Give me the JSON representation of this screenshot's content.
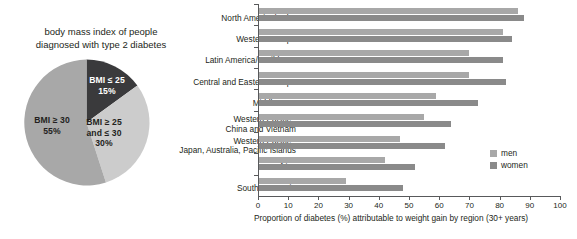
{
  "pie": {
    "title": "body mass index of people diagnosed with type 2 diabetes",
    "title_line1": "body mass index of people",
    "title_line2": "diagnosed with type 2 diabetes",
    "slices": [
      {
        "label_line1": "BMI ≤ 25",
        "label_line2": "15%",
        "value": 15,
        "color": "#3a3a3c"
      },
      {
        "label_line1": "BMI ≥ 25",
        "label_line2": "and ≤ 30",
        "label_line3": "30%",
        "value": 30,
        "color": "#cccccc"
      },
      {
        "label_line1": "BMI ≥ 30",
        "label_line2": "55%",
        "value": 55,
        "color": "#a8a8a8"
      }
    ]
  },
  "legend": {
    "items": [
      {
        "label": "men",
        "color": "#a8a8a8"
      },
      {
        "label": "women",
        "color": "#8a8a8a"
      }
    ]
  },
  "chart_data": {
    "type": "bar",
    "title": "",
    "xlabel": "Proportion of diabetes (%) attributable to weight gain by region (30+ years)",
    "ylabel": "",
    "xlim": [
      0,
      100
    ],
    "xticks": [
      0,
      10,
      20,
      30,
      40,
      50,
      60,
      70,
      80,
      90,
      100
    ],
    "grid": false,
    "legend_position": "right-inside",
    "orientation": "horizontal",
    "categories": [
      "North America/Cuba",
      "Western Europe",
      "Latin America/Caribbean",
      "Central and Eastern Europe",
      "Middle East",
      "Western Pacific - China and Vietnam",
      "Western Pacific - Japan, Australia, Pacific Islands",
      "Africa",
      "South-East Asia"
    ],
    "category_lines": [
      [
        "North America/Cuba"
      ],
      [
        "Western Europe"
      ],
      [
        "Latin America/Caribbean"
      ],
      [
        "Central and Eastern Europe"
      ],
      [
        "Middle East"
      ],
      [
        "Western Pacific -",
        "China and Vietnam"
      ],
      [
        "Western Pacific -",
        "Japan, Australia, Pacific Islands"
      ],
      [
        "Africa"
      ],
      [
        "South-East Asia"
      ]
    ],
    "series": [
      {
        "name": "men",
        "color": "#a8a8a8",
        "values": [
          86,
          81,
          70,
          70,
          59,
          55,
          47,
          42,
          29
        ]
      },
      {
        "name": "women",
        "color": "#8a8a8a",
        "values": [
          88,
          84,
          81,
          82,
          73,
          64,
          62,
          52,
          48
        ]
      }
    ]
  }
}
